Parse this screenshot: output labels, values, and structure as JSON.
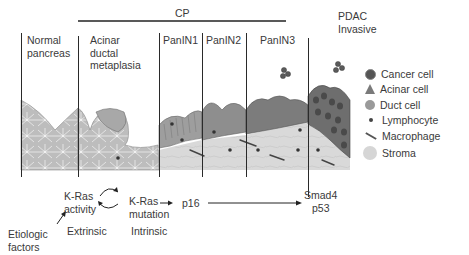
{
  "header": {
    "cp_label": "CP",
    "pdac_label_line1": "PDAC",
    "pdac_label_line2": "Invasive"
  },
  "stages": [
    {
      "line1": "Normal",
      "line2": "pancreas",
      "line3": ""
    },
    {
      "line1": "Acinar",
      "line2": "ductal",
      "line3": "metaplasia"
    },
    {
      "line1": "PanIN1",
      "line2": "",
      "line3": ""
    },
    {
      "line1": "PanIN2",
      "line2": "",
      "line3": ""
    },
    {
      "line1": "PanIN3",
      "line2": "",
      "line3": ""
    }
  ],
  "legend": [
    {
      "label": "Cancer cell",
      "icon": "cancer-cell-icon",
      "color": "#555555"
    },
    {
      "label": "Acinar cell",
      "icon": "acinar-cell-icon",
      "color": "#7a7a7a"
    },
    {
      "label": "Duct cell",
      "icon": "duct-cell-icon",
      "color": "#9a9a9a"
    },
    {
      "label": "Lymphocyte",
      "icon": "lymphocyte-icon",
      "color": "#444444"
    },
    {
      "label": "Macrophage",
      "icon": "macrophage-icon",
      "color": "#555555"
    },
    {
      "label": "Stroma",
      "icon": "stroma-icon",
      "color": "#d6d6d6"
    }
  ],
  "pathway": {
    "kras_activity_line1": "K-Ras",
    "kras_activity_line2": "activity",
    "kras_mutation_line1": "K-Ras",
    "kras_mutation_line2": "mutation",
    "p16": "p16",
    "smad4": "Smad4",
    "p53": "p53",
    "extrinsic": "Extrinsic",
    "intrinsic": "Intrinsic",
    "etiologic_line1": "Etiologic",
    "etiologic_line2": "factors"
  }
}
